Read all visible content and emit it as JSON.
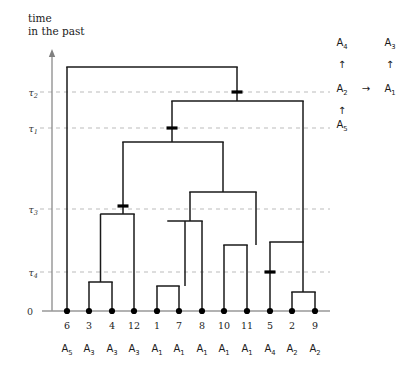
{
  "axis": {
    "title_line1": "time",
    "title_line2": "in the past",
    "zero_label": "0",
    "ticks": [
      {
        "id": "tau2",
        "base": "τ",
        "sub": "2",
        "y": 92
      },
      {
        "id": "tau1",
        "base": "τ",
        "sub": "1",
        "y": 128
      },
      {
        "id": "tau3",
        "base": "τ",
        "sub": "3",
        "y": 209
      },
      {
        "id": "tau4",
        "base": "τ",
        "sub": "4",
        "y": 272
      }
    ]
  },
  "colors": {
    "tree_stroke": "#1a1a1a",
    "axis_stroke": "#808080",
    "gridline": "#b3b3b3",
    "leaf_dot": "#000000",
    "mutation": "#000000",
    "text": "#1a1a1a"
  },
  "chart_data": {
    "type": "tree",
    "title": "",
    "xlabel": "",
    "ylabel": "time in the past",
    "grid": true,
    "time_axis": {
      "direction": "up",
      "zero_at_bottom": true,
      "labeled_levels": [
        "0",
        "τ₄",
        "τ₃",
        "τ₁",
        "τ₂"
      ]
    },
    "leaves": [
      {
        "id": "6",
        "allele": "A",
        "allele_sub": "5",
        "x": 67
      },
      {
        "id": "3",
        "allele": "A",
        "allele_sub": "3",
        "x": 89
      },
      {
        "id": "4",
        "allele": "A",
        "allele_sub": "3",
        "x": 112
      },
      {
        "id": "12",
        "allele": "A",
        "allele_sub": "3",
        "x": 134
      },
      {
        "id": "1",
        "allele": "A",
        "allele_sub": "1",
        "x": 157
      },
      {
        "id": "7",
        "allele": "A",
        "allele_sub": "1",
        "x": 179
      },
      {
        "id": "8",
        "allele": "A",
        "allele_sub": "1",
        "x": 202
      },
      {
        "id": "10",
        "allele": "A",
        "allele_sub": "1",
        "x": 224
      },
      {
        "id": "11",
        "allele": "A",
        "allele_sub": "1",
        "x": 247
      },
      {
        "id": "5",
        "allele": "A",
        "allele_sub": "4",
        "x": 270
      },
      {
        "id": "2",
        "allele": "A",
        "allele_sub": "2",
        "x": 292
      },
      {
        "id": "9",
        "allele": "A",
        "allele_sub": "2",
        "x": 315
      }
    ],
    "internal_nodes": [
      {
        "name": "root",
        "y": 67,
        "left_x": 67,
        "right_x": 237
      },
      {
        "name": "node-tau2",
        "y": 101,
        "left_x": 172,
        "right_x": 303
      },
      {
        "name": "node-a",
        "y": 142,
        "left_x": 123,
        "right_x": 223
      },
      {
        "name": "node-b",
        "y": 192,
        "left_x": 190,
        "right_x": 256
      },
      {
        "name": "node-c",
        "y": 214,
        "left_x": 101,
        "right_x": 134
      },
      {
        "name": "node-d",
        "y": 221,
        "left_x": 168,
        "right_x": 202
      },
      {
        "name": "node-e",
        "y": 242,
        "left_x": 270,
        "right_x": 303
      },
      {
        "name": "node-f",
        "y": 245,
        "left_x": 224,
        "right_x": 247
      },
      {
        "name": "node-g",
        "y": 282,
        "left_x": 89,
        "right_x": 112
      },
      {
        "name": "node-h",
        "y": 286,
        "left_x": 157,
        "right_x": 179
      },
      {
        "name": "node-i",
        "y": 292,
        "left_x": 292,
        "right_x": 315
      }
    ],
    "mutations": [
      {
        "name": "mutation-tau2",
        "x": 237,
        "y": 92
      },
      {
        "name": "mutation-tau1",
        "x": 172,
        "y": 128
      },
      {
        "name": "mutation-tau3",
        "x": 123,
        "y": 206
      },
      {
        "name": "mutation-tau4",
        "x": 270,
        "y": 272
      }
    ]
  },
  "allele_graph": {
    "nodes": [
      {
        "name": "A4",
        "base": "A",
        "sub": "4",
        "x": 342,
        "y": 46
      },
      {
        "name": "A3",
        "base": "A",
        "sub": "3",
        "x": 390,
        "y": 46
      },
      {
        "name": "A2",
        "base": "A",
        "sub": "2",
        "x": 342,
        "y": 92
      },
      {
        "name": "A1",
        "base": "A",
        "sub": "1",
        "x": 390,
        "y": 92
      },
      {
        "name": "A5",
        "base": "A",
        "sub": "5",
        "x": 342,
        "y": 128
      }
    ],
    "arrows": [
      {
        "name": "arrow-a2-to-a4",
        "glyph": "↑",
        "x": 342,
        "y": 68
      },
      {
        "name": "arrow-a1-to-a3",
        "glyph": "↑",
        "x": 390,
        "y": 68
      },
      {
        "name": "arrow-a5-to-a2",
        "glyph": "↑",
        "x": 342,
        "y": 114
      },
      {
        "name": "arrow-a2-to-a1",
        "glyph": "→",
        "x": 366,
        "y": 92
      }
    ]
  }
}
